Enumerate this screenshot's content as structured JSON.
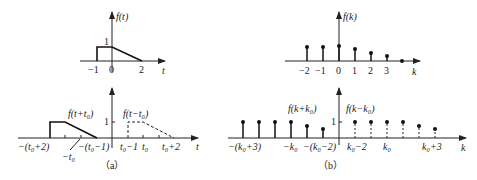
{
  "figure": {
    "panel_a": {
      "caption": "（a）",
      "top": {
        "ylabel": "f(t)",
        "xlabel": "t",
        "tick_labels": [
          "−1",
          "0",
          "2"
        ],
        "level_label": "1"
      },
      "bottom": {
        "xlabel": "t",
        "level_label": "1",
        "left_curve_label": "f(t+t₀)",
        "right_curve_label": "f(t−t₀)",
        "tick_labels": [
          "−(t₀+2)",
          "−t₀",
          "−(t₀−1)",
          "t₀−1",
          "t₀",
          "t₀+2"
        ]
      }
    },
    "panel_b": {
      "caption": "（b）",
      "top": {
        "ylabel": "f(k)",
        "xlabel": "k",
        "tick_labels": [
          "−2",
          "−1",
          "0",
          "1",
          "2",
          "3"
        ]
      },
      "bottom": {
        "xlabel": "k",
        "level_label": "1",
        "left_seq_label": "f(k+k₀)",
        "right_seq_label": "f(k−k₀)",
        "tick_labels": [
          "−(k₀+3)",
          "−k₀",
          "−(k₀−2)",
          "k₀−2",
          "k₀",
          "k₀+3"
        ]
      }
    }
  }
}
